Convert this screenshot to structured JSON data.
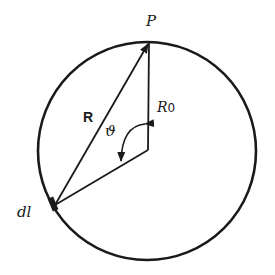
{
  "diagram": {
    "type": "geometry",
    "colors": {
      "stroke": "#1a1a1a",
      "background": "#ffffff"
    },
    "labels": {
      "point_p": "P",
      "vector_r": "R",
      "radius_r0": "R",
      "radius_r0_sub": "0",
      "angle_theta": "ϑ",
      "element_dl": "dl"
    },
    "geometry": {
      "circle": {
        "cx": 147,
        "cy": 151,
        "r": 109
      },
      "point_p": {
        "x": 150,
        "y": 42
      },
      "center_point": {
        "x": 148,
        "y": 150
      },
      "element_dl": {
        "x": 55,
        "y": 205
      }
    }
  }
}
